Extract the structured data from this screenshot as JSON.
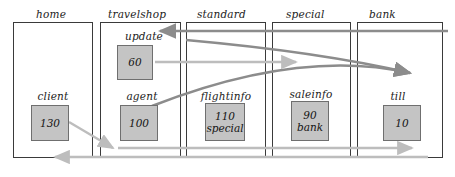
{
  "diagram": {
    "type": "object-collaboration-diagram",
    "canvas": {
      "width": 455,
      "height": 177
    },
    "colors": {
      "box_fill": "#c4c4c4",
      "box_stroke": "#6f6f6f",
      "column_stroke": "#3a3a3a",
      "arrow_dark": "#8c8c8c",
      "arrow_light": "#bdbdbd",
      "text": "#1b1b1b",
      "background": "#ffffff"
    },
    "columns": [
      {
        "id": "home",
        "label": "home",
        "x": 13,
        "y": 22,
        "width": 79,
        "height": 135,
        "label_x": 36,
        "label_y": 8
      },
      {
        "id": "travelshop",
        "label": "travelshop",
        "x": 100,
        "y": 22,
        "width": 80,
        "height": 135,
        "label_x": 108,
        "label_y": 8
      },
      {
        "id": "standard",
        "label": "standard",
        "x": 186,
        "y": 22,
        "width": 79,
        "height": 135,
        "label_x": 197,
        "label_y": 8
      },
      {
        "id": "special",
        "label": "special",
        "x": 272,
        "y": 22,
        "width": 78,
        "height": 135,
        "label_x": 286,
        "label_y": 8
      },
      {
        "id": "bank",
        "label": "bank",
        "x": 357,
        "y": 22,
        "width": 85,
        "height": 135,
        "label_x": 369,
        "label_y": 8
      }
    ],
    "objects": [
      {
        "id": "update",
        "label": "update",
        "label_x": 117,
        "label_y": 30,
        "label_width": 54,
        "box": {
          "x": 117,
          "y": 45,
          "width": 36,
          "height": 35
        },
        "lines": [
          "60"
        ]
      },
      {
        "id": "client",
        "label": "client",
        "label_x": 26,
        "label_y": 90,
        "label_width": 54,
        "box": {
          "x": 31,
          "y": 105,
          "width": 38,
          "height": 36
        },
        "lines": [
          "130"
        ]
      },
      {
        "id": "agent",
        "label": "agent",
        "label_x": 115,
        "label_y": 90,
        "label_width": 54,
        "box": {
          "x": 120,
          "y": 105,
          "width": 38,
          "height": 36
        },
        "lines": [
          "100"
        ]
      },
      {
        "id": "flightinfo",
        "label": "flightinfo",
        "label_x": 198,
        "label_y": 90,
        "label_width": 56,
        "box": {
          "x": 205,
          "y": 103,
          "width": 40,
          "height": 38
        },
        "lines": [
          "110",
          "special"
        ]
      },
      {
        "id": "saleinfo",
        "label": "saleinfo",
        "label_x": 283,
        "label_y": 88,
        "label_width": 56,
        "box": {
          "x": 291,
          "y": 101,
          "width": 38,
          "height": 40
        },
        "lines": [
          "90",
          "bank"
        ]
      },
      {
        "id": "till",
        "label": "till",
        "label_x": 378,
        "label_y": 90,
        "label_width": 40,
        "box": {
          "x": 383,
          "y": 105,
          "width": 38,
          "height": 36
        },
        "lines": [
          "10"
        ]
      }
    ],
    "arrows": [
      {
        "id": "arrow-update-inbound",
        "style": "dark",
        "kind": "straight",
        "description": "from bank column leftward into update",
        "from": {
          "x": 448,
          "y": 31
        },
        "to": {
          "x": 160,
          "y": 31
        },
        "direction": "left"
      },
      {
        "id": "arrow-agent-to-bank",
        "style": "dark",
        "kind": "curve",
        "description": "from agent curving right into bank",
        "from": {
          "x": 152,
          "y": 106
        },
        "control": {
          "x": 300,
          "y": 48
        },
        "to": {
          "x": 410,
          "y": 73
        },
        "direction": "right"
      },
      {
        "id": "arrow-standard-to-bank",
        "style": "dark",
        "kind": "curve",
        "description": "from standard column curving right into bank",
        "from": {
          "x": 186,
          "y": 40
        },
        "control": {
          "x": 320,
          "y": 52
        },
        "to": {
          "x": 410,
          "y": 73
        },
        "direction": "right"
      },
      {
        "id": "arrow-update-to-special",
        "style": "light",
        "kind": "straight",
        "description": "from update rightward into special",
        "from": {
          "x": 155,
          "y": 62
        },
        "to": {
          "x": 296,
          "y": 62
        },
        "direction": "right"
      },
      {
        "id": "arrow-client-to-agent",
        "style": "light",
        "kind": "straight",
        "description": "from client diagonally down-right to agent lane",
        "from": {
          "x": 69,
          "y": 122
        },
        "to": {
          "x": 113,
          "y": 148
        },
        "direction": "right"
      },
      {
        "id": "arrow-agent-rightward",
        "style": "light",
        "kind": "straight",
        "description": "long rightward arrow through flightinfo, saleinfo to till",
        "from": {
          "x": 118,
          "y": 148
        },
        "to": {
          "x": 412,
          "y": 148
        },
        "direction": "right"
      },
      {
        "id": "arrow-return-leftward",
        "style": "light",
        "kind": "straight",
        "description": "long leftward return arrow back to home",
        "from": {
          "x": 428,
          "y": 157
        },
        "to": {
          "x": 55,
          "y": 157
        },
        "direction": "left"
      }
    ]
  }
}
